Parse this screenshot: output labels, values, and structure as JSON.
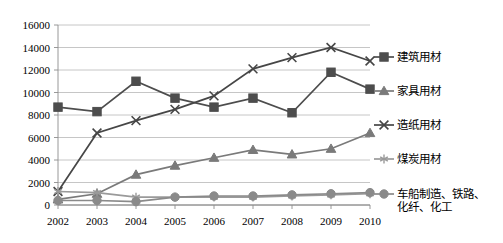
{
  "chart_data": {
    "type": "line",
    "title": "",
    "xlabel": "",
    "ylabel": "",
    "categories": [
      "2002",
      "2003",
      "2004",
      "2005",
      "2006",
      "2007",
      "2008",
      "2009",
      "2010"
    ],
    "ylim": [
      0,
      16000
    ],
    "ytick_step": 2000,
    "yticks": [
      "0",
      "2000",
      "4000",
      "6000",
      "8000",
      "10000",
      "12000",
      "14000",
      "16000"
    ],
    "grid": "horizontal",
    "legend_position": "right",
    "series": [
      {
        "name": "建筑用材",
        "marker": "square",
        "color": "#4d4d4d",
        "values": [
          8700,
          8300,
          11000,
          9500,
          8700,
          9500,
          8200,
          11800,
          10300
        ]
      },
      {
        "name": "家具用材",
        "marker": "triangle",
        "color": "#7a7a7a",
        "values": [
          500,
          1000,
          2700,
          3500,
          4200,
          4900,
          4500,
          5000,
          6400
        ]
      },
      {
        "name": "造纸用材",
        "marker": "x",
        "color": "#464646",
        "values": [
          1200,
          6400,
          7500,
          8500,
          9700,
          12100,
          13100,
          14000,
          12800
        ]
      },
      {
        "name": "煤炭用材",
        "marker": "asterisk",
        "color": "#9a9a9a",
        "values": [
          1200,
          1100,
          700,
          700,
          700,
          700,
          800,
          900,
          1000
        ]
      },
      {
        "name": "车船制造、铁路、\n化纤、化工",
        "marker": "circle",
        "color": "#8a8a8a",
        "values": [
          400,
          400,
          300,
          700,
          800,
          800,
          900,
          1000,
          1100
        ]
      }
    ]
  },
  "legend": {
    "items": [
      {
        "label": "建筑用材"
      },
      {
        "label": "家具用材"
      },
      {
        "label": "造纸用材"
      },
      {
        "label": "煤炭用材"
      },
      {
        "label": "车船制造、铁路、\n化纤、化工"
      }
    ]
  }
}
